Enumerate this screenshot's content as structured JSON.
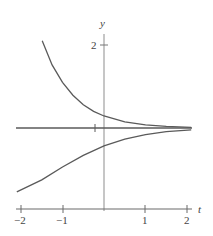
{
  "chart_data": {
    "type": "line",
    "title": "",
    "xlabel": "t",
    "ylabel": "y",
    "xlim": [
      -2,
      2
    ],
    "ylim": [
      -2,
      2.2
    ],
    "x_ticks": [
      "-2",
      "-1",
      "1",
      "2"
    ],
    "y_ticks": [
      "2"
    ],
    "grid": false,
    "legend": null,
    "equilibrium": {
      "y": 0,
      "marker_t": -0.22
    },
    "series": [
      {
        "name": "upper solution",
        "points": [
          [
            -1.49,
            2.1
          ],
          [
            -1.25,
            1.52
          ],
          [
            -1.0,
            1.1
          ],
          [
            -0.75,
            0.79
          ],
          [
            -0.5,
            0.56
          ],
          [
            -0.25,
            0.4
          ],
          [
            0,
            0.29
          ],
          [
            0.5,
            0.15
          ],
          [
            1.0,
            0.077
          ],
          [
            1.5,
            0.039
          ],
          [
            2.1,
            0.018
          ]
        ]
      },
      {
        "name": "equilibrium solution",
        "points": [
          [
            -2.1,
            0
          ],
          [
            2.1,
            0
          ]
        ]
      },
      {
        "name": "lower solution",
        "points": [
          [
            -2.1,
            -1.54
          ],
          [
            -1.5,
            -1.25
          ],
          [
            -1.0,
            -0.94
          ],
          [
            -0.5,
            -0.66
          ],
          [
            0,
            -0.43
          ],
          [
            0.5,
            -0.27
          ],
          [
            1.0,
            -0.16
          ],
          [
            1.5,
            -0.09
          ],
          [
            2.1,
            -0.045
          ]
        ]
      }
    ]
  },
  "labels": {
    "y_axis": "y",
    "t_axis": "t",
    "y_tick_2": "2",
    "t_tick_m2": "−2",
    "t_tick_m1": "−1",
    "t_tick_1": "1",
    "t_tick_2": "2"
  },
  "colors": {
    "curve": "#5a5a5a",
    "axis": "#a8a8a8",
    "t_axis": "#6a6a6a"
  }
}
